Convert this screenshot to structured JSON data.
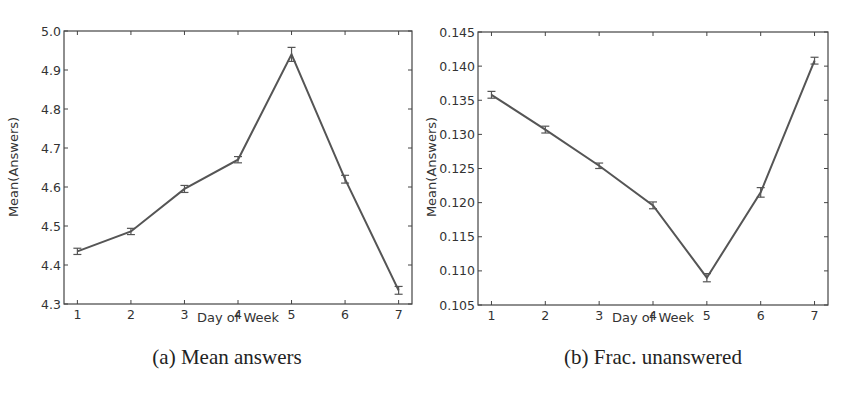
{
  "chart_data": [
    {
      "type": "line",
      "id": "a",
      "caption": "(a) Mean answers",
      "title": "",
      "xlabel": "Day of Week",
      "ylabel": "Mean(Answers)",
      "x": [
        1,
        2,
        3,
        4,
        5,
        6,
        7
      ],
      "values": [
        4.435,
        4.486,
        4.595,
        4.67,
        4.94,
        4.62,
        4.335
      ],
      "error": [
        0.008,
        0.008,
        0.009,
        0.008,
        0.018,
        0.01,
        0.01
      ],
      "xlim": [
        0.75,
        7.25
      ],
      "ylim": [
        4.3,
        5.0
      ],
      "xticks": [
        "1",
        "2",
        "3",
        "4",
        "5",
        "6",
        "7"
      ],
      "yticks": [
        "4.3",
        "4.4",
        "4.5",
        "4.6",
        "4.7",
        "4.8",
        "4.9",
        "5.0"
      ],
      "grid": false,
      "legend": null
    },
    {
      "type": "line",
      "id": "b",
      "caption": "(b) Frac. unanswered",
      "title": "",
      "xlabel": "Day of Week",
      "ylabel": "Mean(Answers)",
      "x": [
        1,
        2,
        3,
        4,
        5,
        6,
        7
      ],
      "values": [
        0.1358,
        0.1307,
        0.1254,
        0.1196,
        0.109,
        0.1215,
        0.1408
      ],
      "error": [
        0.0005,
        0.0005,
        0.0004,
        0.0005,
        0.0006,
        0.0007,
        0.0005
      ],
      "xlim": [
        0.75,
        7.25
      ],
      "ylim": [
        0.105,
        0.145
      ],
      "xticks": [
        "1",
        "2",
        "3",
        "4",
        "5",
        "6",
        "7"
      ],
      "yticks": [
        "0.105",
        "0.110",
        "0.115",
        "0.120",
        "0.125",
        "0.130",
        "0.135",
        "0.140",
        "0.145"
      ],
      "grid": false,
      "legend": null
    }
  ],
  "style": {
    "line_color": "#555555",
    "frame_color": "#444444",
    "text_color": "#333333"
  },
  "layout": [
    {
      "plot": {
        "left": 64,
        "top": 31,
        "right": 412,
        "bottom": 304
      }
    },
    {
      "plot": {
        "left": 478,
        "top": 32,
        "right": 828,
        "bottom": 305
      }
    }
  ]
}
